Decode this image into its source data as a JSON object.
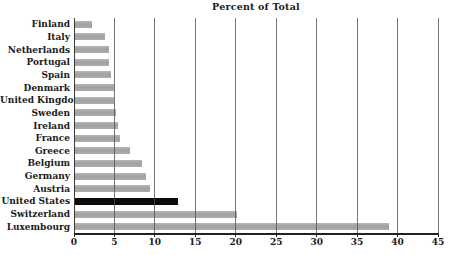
{
  "title": "Percent of Total",
  "colors": {
    "background": "#ffffff",
    "bar": "#a9a9a9",
    "highlight_bar": "#0c0c0c",
    "gridline": "#505050",
    "axis": "#222222",
    "text": "#1a1a1a"
  },
  "chart_data": {
    "type": "bar",
    "orientation": "horizontal",
    "title": "Percent of Total",
    "categories": [
      "Finland",
      "Italy",
      "Netherlands",
      "Portugal",
      "Spain",
      "Denmark",
      "United Kingdom",
      "Sweden",
      "Ireland",
      "France",
      "Greece",
      "Belgium",
      "Germany",
      "Austria",
      "United States",
      "Switzerland",
      "Luxembourg"
    ],
    "values": [
      2.2,
      3.8,
      4.3,
      4.3,
      4.6,
      4.9,
      5.0,
      5.2,
      5.5,
      5.7,
      6.9,
      8.4,
      8.9,
      9.4,
      12.8,
      20.1,
      39.0
    ],
    "highlighted_category": "United States",
    "xlabel": "",
    "ylabel": "",
    "xlim": [
      0,
      45
    ],
    "x_ticks": [
      0,
      5,
      10,
      15,
      20,
      25,
      30,
      35,
      40,
      45
    ],
    "grid": "vertical gridlines at every x tick, drawn over bars",
    "legend": "none"
  }
}
